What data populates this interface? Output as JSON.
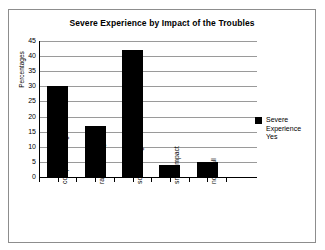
{
  "chart_data": {
    "type": "bar",
    "title": "Severe Experience by Impact of the Troubles",
    "xlabel": "",
    "ylabel": "Percentages",
    "categories": [
      "complete change",
      "radical change",
      "some change",
      "small impact",
      "not at all"
    ],
    "values": [
      30,
      17,
      42,
      4,
      5
    ],
    "series": [
      {
        "name": "Severe Experience Yes",
        "values": [
          30,
          17,
          42,
          4,
          5
        ]
      }
    ],
    "ylim": [
      0,
      45
    ],
    "ytick_labels": [
      "0",
      "5",
      "10",
      "15",
      "20",
      "25",
      "30",
      "35",
      "40",
      "45"
    ],
    "ytick_values": [
      0,
      5,
      10,
      15,
      20,
      25,
      30,
      35,
      40,
      45
    ],
    "grid": true,
    "legend_position": "right",
    "bar_color": "#000000",
    "grid_color": "#9a9a9a",
    "axis_color": "#000000",
    "background": "#ffffff"
  },
  "legend": {
    "entries": [
      {
        "label_line_1": "Severe",
        "label_line_2": "Experience",
        "label_line_3": "Yes",
        "full_label": "Severe Experience Yes",
        "color": "#000000"
      }
    ]
  }
}
